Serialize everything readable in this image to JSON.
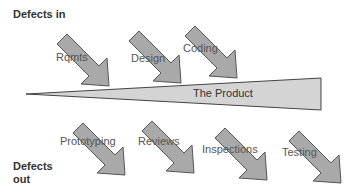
{
  "diagram": {
    "defects_in_label": "Defects in",
    "defects_out_line1": "Defects",
    "defects_out_line2": "out",
    "product_label": "The Product",
    "inputs": [
      {
        "label": "Rqmts"
      },
      {
        "label": "Design"
      },
      {
        "label": "Coding"
      }
    ],
    "outputs": [
      {
        "label": "Prototyping"
      },
      {
        "label": "Reviews"
      },
      {
        "label": "Inspections"
      },
      {
        "label": "Testing"
      }
    ],
    "colors": {
      "arrow_fill": "#a9a9a9",
      "arrow_stroke": "#555555",
      "wedge_fill": "#d4d4d4",
      "wedge_stroke": "#444444"
    }
  }
}
